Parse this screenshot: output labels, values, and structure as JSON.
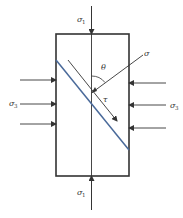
{
  "figure": {
    "type": "stress-element-diagram"
  },
  "labels": {
    "sigma1_top": {
      "symbol": "σ",
      "subscript": "1"
    },
    "sigma1_bottom": {
      "symbol": "σ",
      "subscript": "1"
    },
    "sigma3_left": {
      "symbol": "σ",
      "subscript": "3"
    },
    "sigma3_right": {
      "symbol": "σ",
      "subscript": "3"
    },
    "normal_stress": {
      "symbol": "σ"
    },
    "shear_stress": {
      "symbol": "τ"
    },
    "angle": {
      "symbol": "θ"
    }
  },
  "colors": {
    "outline": "#333333",
    "plane": "#4a6a9a",
    "text": "#333333"
  }
}
